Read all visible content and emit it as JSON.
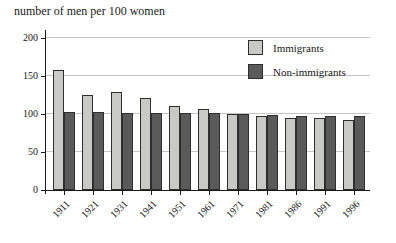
{
  "chart_data": {
    "type": "bar",
    "title": "number of men per 100 women",
    "categories": [
      "1911",
      "1921",
      "1931",
      "1941",
      "1951",
      "1961",
      "1971",
      "1981",
      "1986",
      "1991",
      "1996"
    ],
    "series": [
      {
        "name": "Immigrants",
        "color": "#c9c9c6",
        "values": [
          158,
          125,
          129,
          121,
          111,
          106,
          100,
          97,
          95,
          95,
          92
        ]
      },
      {
        "name": "Non-immigrants",
        "color": "#5a5a5a",
        "values": [
          102,
          102,
          101,
          101,
          101,
          101,
          100,
          99,
          98,
          98,
          98
        ]
      }
    ],
    "xlabel": "",
    "ylabel": "number of men per 100 women",
    "ylim": [
      0,
      200
    ],
    "yticks": [
      0,
      50,
      100,
      150,
      200
    ],
    "grid": true,
    "legend_position": "upper-right-inside",
    "colors": {
      "axis": "#1a1a1a",
      "gridline": "#c6c6c6",
      "bar_border": "#2e2e2e",
      "background": "#ffffff"
    }
  }
}
